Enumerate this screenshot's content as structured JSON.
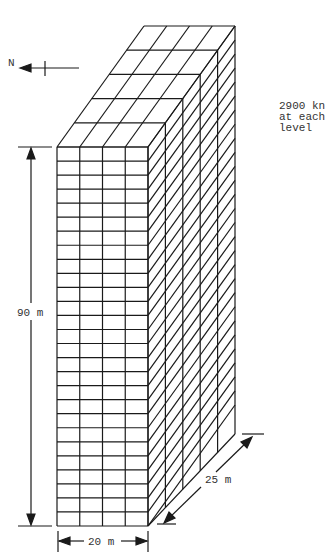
{
  "diagram": {
    "north_label": "N",
    "note_lines": [
      "2900 kn",
      "at each",
      "level"
    ],
    "dimensions": {
      "height_label": "90 m",
      "width_label": "20 m",
      "depth_label": "25 m"
    },
    "grid": {
      "front_columns": 4,
      "levels": 27,
      "depth_bays": 5
    },
    "colors": {
      "line": "#1a1a1a",
      "text": "#333333",
      "background": "#ffffff"
    }
  }
}
